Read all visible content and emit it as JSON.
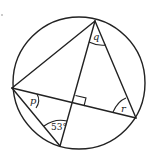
{
  "diagram": {
    "type": "circle-geometry",
    "colors": {
      "stroke": "#222222",
      "background": "#ffffff"
    },
    "circle": {
      "cx": 79,
      "cy": 83,
      "r": 66
    },
    "points": {
      "top": {
        "x": 95,
        "y": 21
      },
      "left": {
        "x": 12,
        "y": 88
      },
      "bottom": {
        "x": 60,
        "y": 146
      },
      "right": {
        "x": 136,
        "y": 118
      },
      "intersection": {
        "x": 73,
        "y": 104
      }
    },
    "labels": {
      "q": "q",
      "p": "p",
      "r": "r",
      "angle_53": "53°"
    },
    "right_angle_marker": true
  }
}
